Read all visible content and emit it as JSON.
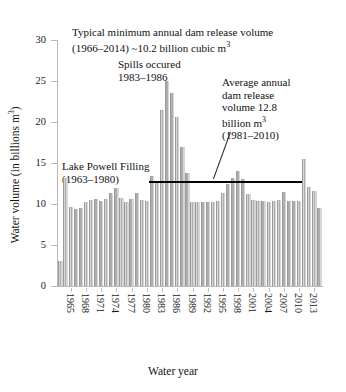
{
  "chart_data": {
    "type": "bar",
    "title": "",
    "xlabel": "Water year",
    "ylabel": "Water volume (in billions m³)",
    "ylim": [
      0,
      30
    ],
    "yticks": [
      0,
      5,
      10,
      15,
      20,
      25,
      30
    ],
    "xticks": [
      1965,
      1968,
      1971,
      1974,
      1977,
      1980,
      1983,
      1986,
      1989,
      1992,
      1995,
      1998,
      2001,
      2004,
      2007,
      2010,
      2013
    ],
    "grid": false,
    "legend": "none",
    "bar_color": "#c9c9c9",
    "categories": [
      1963,
      1964,
      1965,
      1966,
      1967,
      1968,
      1969,
      1970,
      1971,
      1972,
      1973,
      1974,
      1975,
      1976,
      1977,
      1978,
      1979,
      1980,
      1981,
      1982,
      1983,
      1984,
      1985,
      1986,
      1987,
      1988,
      1989,
      1990,
      1991,
      1992,
      1993,
      1994,
      1995,
      1996,
      1997,
      1998,
      1999,
      2000,
      2001,
      2002,
      2003,
      2004,
      2005,
      2006,
      2007,
      2008,
      2009,
      2010,
      2011,
      2012,
      2013,
      2014
    ],
    "values": [
      3.0,
      13.2,
      9.6,
      9.4,
      9.5,
      10.3,
      10.5,
      10.6,
      10.4,
      10.6,
      11.3,
      11.9,
      10.7,
      10.3,
      10.6,
      11.4,
      10.5,
      10.4,
      13.4,
      12.6,
      21.5,
      25.0,
      23.5,
      20.6,
      17.0,
      13.8,
      10.3,
      10.2,
      10.3,
      10.2,
      10.3,
      10.4,
      11.3,
      12.4,
      13.2,
      14.0,
      13.1,
      11.2,
      10.5,
      10.4,
      10.4,
      10.3,
      10.4,
      10.5,
      11.5,
      10.4,
      10.4,
      10.4,
      15.5,
      12.1,
      11.6,
      9.5
    ],
    "annotations": [
      {
        "name": "typical-minimum-note",
        "line1": "Typical minimum annual dam release volume",
        "line2_pre": "(1966–2014) ~10.2 billion cubic m",
        "line2_sup": "3"
      },
      {
        "name": "spills-note",
        "line1": "Spills occured",
        "line2": "1983–1986"
      },
      {
        "name": "average-release-note",
        "line1": "Average annual",
        "line2": "dam release",
        "line3": "volume 12.8",
        "line4_pre": "billion m",
        "line4_sup": "3",
        "line5": "(1981–2010)"
      },
      {
        "name": "lake-powell-filling-note",
        "line1": "Lake Powell Filling",
        "line2": "(1963–1980)"
      }
    ],
    "mean_line": {
      "value": 12.8,
      "start_year": 1981,
      "end_year": 2010,
      "color": "#000000"
    }
  }
}
